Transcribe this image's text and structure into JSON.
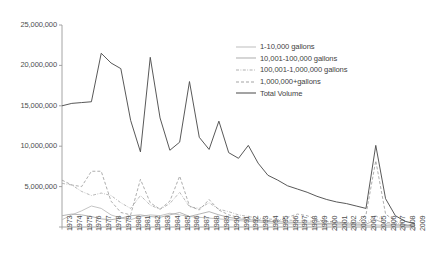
{
  "chart_data": {
    "type": "line",
    "title": "",
    "xlabel": "",
    "ylabel": "",
    "ylim": [
      0,
      25000000
    ],
    "yticks": [
      0,
      5000000,
      10000000,
      15000000,
      20000000,
      25000000
    ],
    "ytick_labels": [
      "0",
      "5,000,000",
      "10,000,000",
      "15,000,000",
      "20,000,000",
      "25,000,000"
    ],
    "grid": false,
    "legend_position": "upper-right",
    "categories": [
      "1973",
      "1974",
      "1975",
      "1976",
      "1977",
      "1978",
      "1979",
      "1980",
      "1981",
      "1982",
      "1983",
      "1984",
      "1985",
      "1986",
      "1987",
      "1988",
      "1989",
      "1990",
      "1991",
      "1992",
      "1993",
      "1994",
      "1995",
      "1996",
      "1997",
      "1998",
      "1999",
      "2000",
      "2001",
      "2002",
      "2003",
      "2004",
      "2005",
      "2006",
      "2007",
      "2008",
      "2009"
    ],
    "series": [
      {
        "name": "1-10,000 gallons",
        "style": "solid-light",
        "values": [
          900000,
          1500000,
          2000000,
          2600000,
          2300000,
          1500000,
          1100000,
          900000,
          1300000,
          1500000,
          1400000,
          1700000,
          1500000,
          1300000,
          1200000,
          1100000,
          1000000,
          900000,
          800000,
          700000,
          600000,
          500000,
          450000,
          400000,
          350000,
          320000,
          300000,
          280000,
          260000,
          240000,
          220000,
          200000,
          260000,
          180000,
          150000,
          120000,
          100000
        ]
      },
      {
        "name": "10,001-100,000 gallons",
        "style": "solid-mid",
        "values": [
          1400000,
          1600000,
          1500000,
          1300000,
          1000000,
          900000,
          1100000,
          1400000,
          1500000,
          1300000,
          1200000,
          1500000,
          1800000,
          1300000,
          1600000,
          1900000,
          1500000,
          1200000,
          1000000,
          900000,
          800000,
          700000,
          650000,
          600000,
          550000,
          500000,
          470000,
          440000,
          400000,
          380000,
          350000,
          330000,
          900000,
          400000,
          300000,
          200000,
          150000
        ]
      },
      {
        "name": "100,001-1,000,000 gallons",
        "style": "dash-dot",
        "values": [
          5400000,
          5200000,
          4400000,
          3900000,
          4200000,
          3900000,
          3000000,
          2300000,
          3900000,
          2700000,
          2200000,
          2900000,
          4300000,
          2500000,
          2300000,
          3000000,
          2200000,
          1900000,
          1500000,
          1300000,
          1100000,
          1000000,
          900000,
          850000,
          800000,
          750000,
          700000,
          650000,
          600000,
          550000,
          520000,
          500000,
          1400000,
          600000,
          450000,
          300000,
          200000
        ]
      },
      {
        "name": "1,000,000+gallons",
        "style": "dashed",
        "values": [
          5800000,
          5200000,
          5000000,
          6900000,
          6900000,
          3200000,
          1800000,
          1500000,
          5900000,
          3000000,
          2200000,
          3200000,
          6300000,
          2600000,
          2100000,
          3400000,
          2100000,
          1500000,
          1200000,
          1000000,
          900000,
          800000,
          700000,
          1200000,
          1600000,
          1400000,
          900000,
          700000,
          600000,
          500000,
          450000,
          1500000,
          8200000,
          1600000,
          700000,
          300000,
          150000
        ]
      },
      {
        "name": "Total Volume",
        "style": "solid-dark",
        "values": [
          15000000,
          15300000,
          15400000,
          15500000,
          21500000,
          20300000,
          19600000,
          13200000,
          9300000,
          21000000,
          13500000,
          9500000,
          10500000,
          18000000,
          11100000,
          9600000,
          13100000,
          9200000,
          8500000,
          10100000,
          7900000,
          6400000,
          5800000,
          5100000,
          4700000,
          4300000,
          3800000,
          3400000,
          3100000,
          2900000,
          2600000,
          2300000,
          10100000,
          3500000,
          1400000,
          700000,
          400000
        ]
      }
    ]
  }
}
